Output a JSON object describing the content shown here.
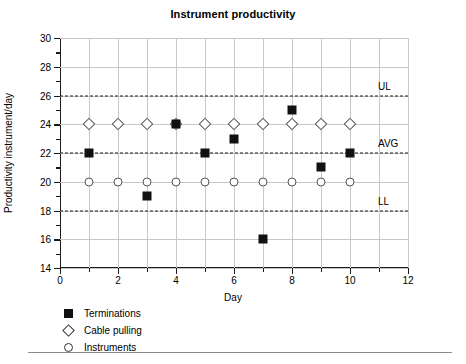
{
  "chart_data": {
    "type": "scatter",
    "title": "Instrument productivity",
    "xlabel": "Day",
    "ylabel": "Productivity instrument/day",
    "xlim": [
      0,
      12
    ],
    "ylim": [
      14,
      30
    ],
    "x_ticks": [
      0,
      2,
      4,
      6,
      8,
      10,
      12
    ],
    "x_tick_labels": [
      "0",
      "2",
      "4",
      "6",
      "8",
      "10",
      "12"
    ],
    "x_minor_ticks": [
      1,
      3,
      5,
      7,
      9,
      11
    ],
    "y_ticks": [
      14,
      16,
      18,
      20,
      22,
      24,
      26,
      28,
      30
    ],
    "y_tick_labels": [
      "14",
      "16",
      "18",
      "20",
      "22",
      "24",
      "26",
      "28",
      "30"
    ],
    "y_minor_ticks": [
      15,
      17,
      19,
      21,
      23,
      25,
      27,
      29
    ],
    "grid": true,
    "legend_position": "below-left",
    "x": [
      1,
      2,
      3,
      4,
      5,
      6,
      7,
      8,
      9,
      10
    ],
    "series": [
      {
        "name": "Terminations",
        "marker": "filled-square",
        "x": [
          1,
          3,
          4,
          5,
          6,
          7,
          8,
          9,
          10
        ],
        "values": [
          22,
          19,
          24,
          22,
          23,
          16,
          25,
          21,
          22
        ]
      },
      {
        "name": "Cable pulling",
        "marker": "open-diamond",
        "x": [
          1,
          2,
          3,
          4,
          5,
          6,
          7,
          8,
          9,
          10
        ],
        "values": [
          24,
          24,
          24,
          24,
          24,
          24,
          24,
          24,
          24,
          24
        ]
      },
      {
        "name": "Instruments",
        "marker": "open-circle",
        "x": [
          1,
          2,
          3,
          4,
          5,
          6,
          7,
          8,
          9,
          10
        ],
        "values": [
          20,
          20,
          20,
          20,
          20,
          20,
          20,
          20,
          20,
          20
        ]
      }
    ],
    "reference_lines": [
      {
        "label": "UL",
        "value": 26,
        "style": "dashed"
      },
      {
        "label": "AVG",
        "value": 22,
        "style": "dashed"
      },
      {
        "label": "LL",
        "value": 18,
        "style": "dashed"
      }
    ],
    "colors": {
      "marker": "#111111",
      "axis": "#1a1a1a",
      "grid": "#c8c8c8",
      "background": "#ffffff"
    }
  }
}
